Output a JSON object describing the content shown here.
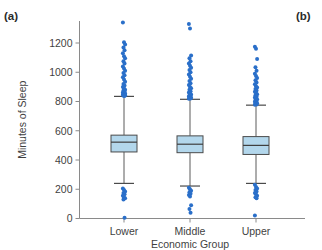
{
  "figure": {
    "panel_a_label": "(a)",
    "panel_b_label": "(b)"
  },
  "axes": {
    "ylabel": "Minutes of Sleep",
    "xlabel": "Economic Group",
    "yticks": [
      0,
      200,
      400,
      600,
      800,
      1000,
      1200
    ],
    "ytick_labels": [
      "0",
      "200",
      "400",
      "600",
      "800",
      "1000",
      "1200"
    ],
    "xtick_labels": [
      "Lower",
      "Middle",
      "Upper"
    ],
    "ylim": [
      0,
      1380
    ],
    "grid": false,
    "legend": "none"
  },
  "colors": {
    "box_fill": "#b3d7ec",
    "box_edge": "#4a4a4a",
    "outlier": "#2a6fc9",
    "axis": "#8a8a8a",
    "text": "#3f3f3f",
    "background": "#ffffff"
  },
  "chart_data": {
    "type": "box",
    "title": "",
    "xlabel": "Economic Group",
    "ylabel": "Minutes of Sleep",
    "ylim": [
      0,
      1380
    ],
    "yticks": [
      0,
      200,
      400,
      600,
      800,
      1000,
      1200
    ],
    "categories": [
      "Lower",
      "Middle",
      "Upper"
    ],
    "boxes": [
      {
        "category": "Lower",
        "whisker_low": 240,
        "q1": 455,
        "median": 522,
        "q3": 570,
        "whisker_high": 835,
        "outliers_high": [
          1340,
          1205,
          1190,
          1170,
          1150,
          1130,
          1110,
          1095,
          1075,
          1060,
          1040,
          1025,
          1010,
          995,
          980,
          965,
          950,
          935,
          920,
          910,
          900,
          890,
          880,
          875,
          868,
          862,
          858,
          854,
          850,
          848,
          846,
          844,
          842,
          840,
          838
        ],
        "outliers_low": [
          205,
          195,
          185,
          175,
          165,
          155,
          145,
          138,
          130,
          5
        ]
      },
      {
        "category": "Middle",
        "whisker_low": 222,
        "q1": 450,
        "median": 508,
        "q3": 565,
        "whisker_high": 815,
        "outliers_high": [
          1330,
          1300,
          1115,
          1095,
          1075,
          1060,
          1045,
          1030,
          1015,
          1000,
          985,
          970,
          955,
          940,
          925,
          912,
          900,
          890,
          880,
          870,
          862,
          855,
          848,
          842,
          838,
          834,
          830,
          826,
          822,
          820,
          818
        ],
        "outliers_low": [
          210,
          200,
          190,
          180,
          170,
          160,
          150,
          90,
          65,
          40
        ]
      },
      {
        "category": "Upper",
        "whisker_low": 240,
        "q1": 438,
        "median": 500,
        "q3": 560,
        "whisker_high": 775,
        "outliers_high": [
          1175,
          1160,
          1090,
          1035,
          1010,
          990,
          975,
          960,
          945,
          930,
          918,
          905,
          895,
          885,
          875,
          866,
          858,
          850,
          842,
          835,
          828,
          822,
          816,
          810,
          804,
          798,
          792,
          788,
          784,
          780,
          778
        ],
        "outliers_low": [
          230,
          215,
          205,
          195,
          185,
          175,
          165,
          155,
          145,
          138,
          20
        ]
      }
    ]
  }
}
